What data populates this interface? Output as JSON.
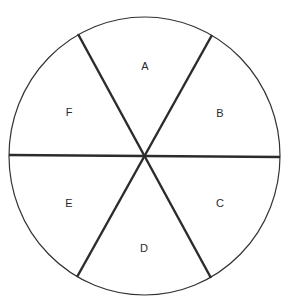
{
  "diagram": {
    "type": "circle-divided-into-six-sectors",
    "circle": {
      "cx": 144.5,
      "cy": 156,
      "rx": 135.5,
      "ry": 139,
      "stroke": "#333333",
      "stroke_width": 1.2
    },
    "spokes": {
      "stroke": "#2b2b2b",
      "stroke_width": 2.4,
      "lines": [
        {
          "x1": 9,
          "y1": 155,
          "x2": 280,
          "y2": 157
        },
        {
          "x1": 78,
          "y1": 34,
          "x2": 211,
          "y2": 278
        },
        {
          "x1": 212,
          "y1": 35,
          "x2": 77,
          "y2": 277
        }
      ]
    },
    "sectors": [
      {
        "label": "A",
        "x": 145,
        "y": 70
      },
      {
        "label": "B",
        "x": 220,
        "y": 117
      },
      {
        "label": "C",
        "x": 220,
        "y": 207
      },
      {
        "label": "D",
        "x": 144,
        "y": 252
      },
      {
        "label": "E",
        "x": 69,
        "y": 207
      },
      {
        "label": "F",
        "x": 69,
        "y": 116
      }
    ]
  }
}
